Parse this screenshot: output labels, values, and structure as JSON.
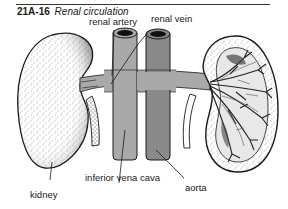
{
  "figure": {
    "number": "21A-16",
    "title": "Renal circulation"
  },
  "labels": {
    "renal_artery": "renal artery",
    "renal_vein": "renal vein",
    "inferior_vena_cava": "inferior vena cava",
    "aorta": "aorta",
    "kidney": "kidney"
  },
  "colors": {
    "vessel_gray": "#a9a9a9",
    "aorta_gray": "#8e8e8e",
    "outline": "#1a1a1a",
    "background": "#ffffff"
  }
}
